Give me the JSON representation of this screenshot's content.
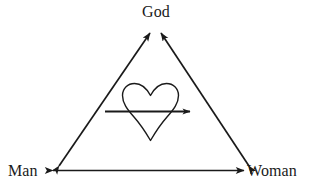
{
  "diagram": {
    "background_color": "#ffffff",
    "stroke_color": "#1a1a1a",
    "nodes": [
      {
        "id": "god",
        "label": "God",
        "position": "top-center",
        "x": 156,
        "y": 12
      },
      {
        "id": "man",
        "label": "Man",
        "position": "bottom-left",
        "x": 26,
        "y": 171
      },
      {
        "id": "woman",
        "label": "Woman",
        "position": "bottom-right",
        "x": 276,
        "y": 171
      }
    ],
    "edges": [
      {
        "id": "man-god",
        "from": "man",
        "to": "god",
        "arrow": "double"
      },
      {
        "id": "woman-god",
        "from": "woman",
        "to": "god",
        "arrow": "double"
      },
      {
        "id": "man-woman",
        "from": "man",
        "to": "woman",
        "arrow": "double"
      }
    ],
    "center_symbol": {
      "id": "heart",
      "icon": "heart-outline-icon",
      "filled": false,
      "arrow": {
        "id": "heart-arrow",
        "icon": "arrow-right-icon",
        "direction": "right",
        "label": ""
      }
    }
  }
}
